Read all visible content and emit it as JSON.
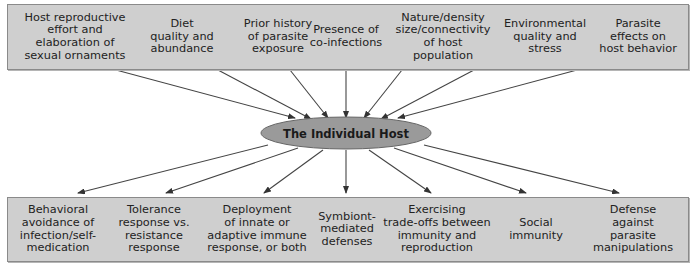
{
  "center": {
    "label": "The Individual Host",
    "fill": "#9a9a9a"
  },
  "box_fill": "#cfcfcf",
  "top_factors": [
    "Host reproductive\neffort and\nelaboration of\nsexual ornaments",
    "Diet\nquality and\nabundance",
    "Prior history\nof parasite\nexposure",
    "Presence of\nco-infections",
    "Nature/density\nsize/connectivity\nof host\npopulation",
    "Environmental\nquality and\nstress",
    "Parasite\neffects on\nhost behavior"
  ],
  "bottom_responses": [
    "Behavioral\navoidance of\ninfection/self-\nmedication",
    "Tolerance\nresponse vs.\nresistance\nresponse",
    "Deployment\nof innate or\nadaptive immune\nresponse, or both",
    "Symbiont-\nmediated\ndefenses",
    "Exercising\ntrade-offs between\nimmunity and\nreproduction",
    "Social\nimmunity",
    "Defense\nagainst\nparasite\nmanipulations"
  ]
}
